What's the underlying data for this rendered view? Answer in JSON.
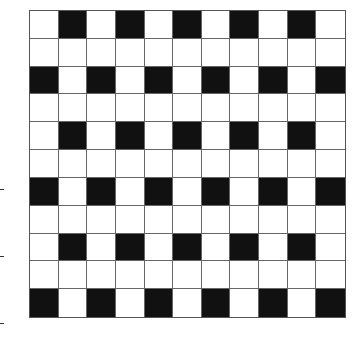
{
  "diagram": {
    "type": "grid-pattern",
    "rows": 11,
    "cols": 11,
    "filled_color": "#111111",
    "empty_color": "#ffffff",
    "line_color": "#666666",
    "pattern": [
      [
        0,
        1,
        0,
        1,
        0,
        1,
        0,
        1,
        0,
        1,
        0
      ],
      [
        0,
        0,
        0,
        0,
        0,
        0,
        0,
        0,
        0,
        0,
        0
      ],
      [
        1,
        0,
        1,
        0,
        1,
        0,
        1,
        0,
        1,
        0,
        1
      ],
      [
        0,
        0,
        0,
        0,
        0,
        0,
        0,
        0,
        0,
        0,
        0
      ],
      [
        0,
        1,
        0,
        1,
        0,
        1,
        0,
        1,
        0,
        1,
        0
      ],
      [
        0,
        0,
        0,
        0,
        0,
        0,
        0,
        0,
        0,
        0,
        0
      ],
      [
        1,
        0,
        1,
        0,
        1,
        0,
        1,
        0,
        1,
        0,
        1
      ],
      [
        0,
        0,
        0,
        0,
        0,
        0,
        0,
        0,
        0,
        0,
        0
      ],
      [
        0,
        1,
        0,
        1,
        0,
        1,
        0,
        1,
        0,
        1,
        0
      ],
      [
        0,
        0,
        0,
        0,
        0,
        0,
        0,
        0,
        0,
        0,
        0
      ],
      [
        1,
        0,
        1,
        0,
        1,
        0,
        1,
        0,
        1,
        0,
        1
      ]
    ],
    "left_tick_marks_y": [
      189,
      256,
      323
    ]
  }
}
